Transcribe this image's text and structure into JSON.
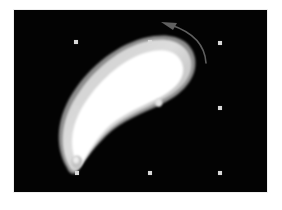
{
  "app": {
    "title": "3D Viewport",
    "background_color": "#ffffff"
  },
  "canvas": {
    "name": "viewport",
    "background_color": "#030303",
    "frame_color": "#efefef",
    "left": 13,
    "top": 9,
    "width": 255,
    "height": 184
  },
  "selection": {
    "label": "selection-handles",
    "handle_color": "#d8d8d8",
    "handle_size": 4,
    "handles": [
      {
        "name": "handle-top-left",
        "x": 60,
        "y": 30,
        "visible": true
      },
      {
        "name": "handle-top-center",
        "x": 134,
        "y": 30,
        "visible": true
      },
      {
        "name": "handle-top-right",
        "x": 204,
        "y": 31,
        "visible": true
      },
      {
        "name": "handle-middle-left",
        "x": 60,
        "y": 96,
        "visible": true
      },
      {
        "name": "handle-middle-center",
        "x": 134,
        "y": 96,
        "visible": false
      },
      {
        "name": "handle-middle-right",
        "x": 204,
        "y": 96,
        "visible": true
      },
      {
        "name": "handle-bottom-left",
        "x": 61,
        "y": 161,
        "visible": true
      },
      {
        "name": "handle-bottom-center",
        "x": 134,
        "y": 161,
        "visible": true
      },
      {
        "name": "handle-bottom-right",
        "x": 204,
        "y": 161,
        "visible": true
      }
    ]
  },
  "object": {
    "name": "banana-shape",
    "description": "Curved elongated white 3D object",
    "fill_highlight": "#ffffff",
    "fill_midtone": "#d6d6d6",
    "fill_shadow": "#9a9a9a",
    "tip_color": "#b9b9b9"
  },
  "rotation_arrow": {
    "name": "rotation-arrow",
    "color": "#5a5a5a",
    "direction": "counter-clockwise",
    "head_x": 148,
    "head_y": 16
  }
}
